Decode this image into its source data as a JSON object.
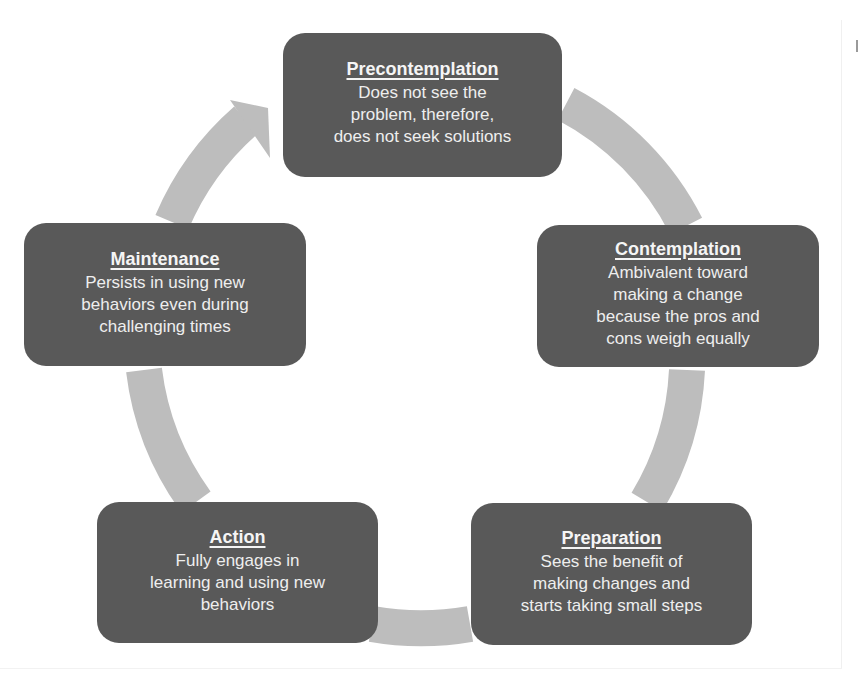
{
  "diagram": {
    "type": "cycle",
    "colors": {
      "box_fill": "#595959",
      "box_text": "#f2f2f2",
      "arrow_fill": "#bdbdbd",
      "background": "#ffffff"
    },
    "stages": [
      {
        "id": "precontemplation",
        "title": "Precontemplation",
        "description": "Does not see the\nproblem, therefore,\ndoes not seek solutions"
      },
      {
        "id": "contemplation",
        "title": "Contemplation",
        "description": "Ambivalent toward\nmaking a change\nbecause the pros and\ncons weigh equally"
      },
      {
        "id": "preparation",
        "title": "Preparation",
        "description": "Sees the benefit of\nmaking changes and\nstarts taking small steps"
      },
      {
        "id": "action",
        "title": "Action",
        "description": "Fully engages in\nlearning and using new\nbehaviors"
      },
      {
        "id": "maintenance",
        "title": "Maintenance",
        "description": "Persists in using new\nbehaviors even during\nchallenging times"
      }
    ],
    "flow": [
      "precontemplation",
      "contemplation",
      "preparation",
      "action",
      "maintenance",
      "precontemplation"
    ]
  }
}
